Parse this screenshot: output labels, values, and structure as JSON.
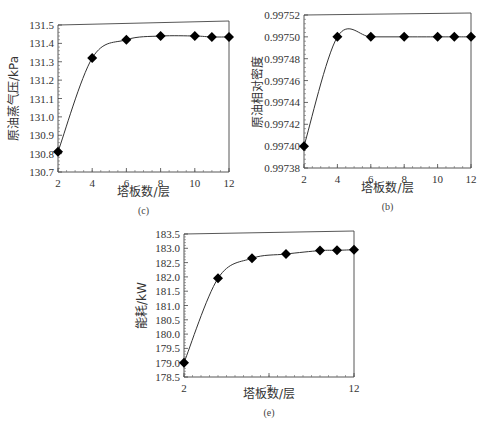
{
  "figure": {
    "caption": ""
  },
  "chart_data": [
    {
      "type": "line",
      "panel_label": "(c)",
      "title": "",
      "xlabel": "塔板数/层",
      "ylabel": "原油蒸气压/kPa",
      "x": [
        2,
        4,
        6,
        8,
        10,
        11,
        12
      ],
      "values": [
        130.81,
        131.32,
        131.42,
        131.44,
        131.44,
        131.435,
        131.435
      ],
      "xlim": [
        2,
        12
      ],
      "ylim": [
        130.7,
        131.5
      ],
      "xticks": [
        "2",
        "4",
        "6",
        "8",
        "10",
        "12"
      ],
      "yticks": [
        "130.7",
        "130.8",
        "130.9",
        "131.0",
        "131.1",
        "131.2",
        "131.3",
        "131.4",
        "131.5"
      ],
      "marker": "diamond",
      "grid": false,
      "legend": null
    },
    {
      "type": "line",
      "panel_label": "(b)",
      "title": "",
      "xlabel": "塔板数/层",
      "ylabel": "原油相对密度",
      "x": [
        2,
        4,
        6,
        8,
        10,
        11,
        12
      ],
      "values": [
        0.9974,
        0.9975,
        0.9975,
        0.9975,
        0.9975,
        0.9975,
        0.9975
      ],
      "xlim": [
        2,
        12
      ],
      "ylim": [
        0.99738,
        0.99752
      ],
      "xticks": [
        "2",
        "4",
        "6",
        "8",
        "10",
        "12"
      ],
      "yticks": [
        "0.99738",
        "0.99740",
        "0.99742",
        "0.99744",
        "0.99746",
        "0.99748",
        "0.99750",
        "0.99752"
      ],
      "marker": "diamond",
      "grid": false,
      "legend": null
    },
    {
      "type": "line",
      "panel_label": "(e)",
      "title": "",
      "xlabel": "塔板数/层",
      "ylabel": "能耗/kW",
      "x": [
        2,
        4,
        6,
        8,
        10,
        11,
        12
      ],
      "values": [
        179.0,
        181.95,
        182.65,
        182.8,
        182.92,
        182.93,
        182.95
      ],
      "xlim": [
        2,
        12
      ],
      "ylim": [
        178.5,
        183.5
      ],
      "xticks": [
        "2",
        "7",
        "12"
      ],
      "yticks": [
        "178.5",
        "179.0",
        "179.5",
        "180.0",
        "180.5",
        "181.0",
        "181.5",
        "182.0",
        "182.5",
        "183.0",
        "183.5"
      ],
      "marker": "diamond",
      "grid": false,
      "legend": null
    }
  ],
  "panels": {
    "c": {
      "xlabel": "塔板数/层",
      "ylabel": "原油蒸气压/kPa",
      "label": "(c)"
    },
    "b": {
      "xlabel": "塔板数/层",
      "ylabel": "原油相对密度",
      "label": "(b)"
    },
    "e": {
      "xlabel": "塔板数/层",
      "ylabel": "能耗/kW",
      "label": "(e)"
    }
  }
}
